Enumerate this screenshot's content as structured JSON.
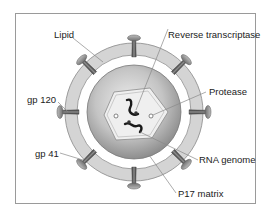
{
  "diagram": {
    "labels": {
      "lipid": "Lipid",
      "reverse_transcriptase": "Reverse transcriptase",
      "gp120": "gp 120",
      "protease": "Protease",
      "gp41": "gp 41",
      "rna_genome": "RNA genome",
      "p17_matrix": "P17 matrix"
    },
    "spike_count": 8,
    "colors": {
      "frame": "#9a9a9a",
      "lipid_ring": "#d4d4d4",
      "lipid_ring_edge": "#8a8a8a",
      "core_center": "#e6e6e6",
      "core_edge": "#8e8e8e",
      "capsid": "#efefef",
      "spike_stem": "#5a5a5a",
      "spike_cap": "#8c8c8c",
      "leader": "#888888",
      "rna": "#1a1a1a"
    }
  }
}
